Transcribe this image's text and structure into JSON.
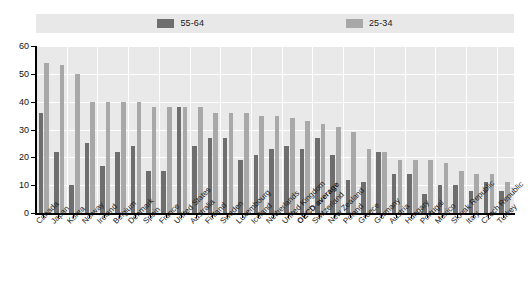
{
  "legend": {
    "items": [
      {
        "label": "55-64",
        "color": "#6e6e6e",
        "icon": "legend-swatch-icon"
      },
      {
        "label": "25-34",
        "color": "#a8a8a8",
        "icon": "legend-swatch-icon"
      }
    ]
  },
  "axis": {
    "y_ticks": [
      "0",
      "10",
      "20",
      "30",
      "40",
      "50",
      "60"
    ]
  },
  "chart_data": {
    "type": "bar",
    "title": "",
    "subtitle": "",
    "xlabel": "",
    "ylabel": "",
    "ylim": [
      0,
      60
    ],
    "ytick_step": 10,
    "grid": true,
    "legend_position": "top",
    "categories": [
      "Canada",
      "Japan",
      "Korea",
      "Norway",
      "Ireland",
      "Belgium",
      "Denmark",
      "Spain",
      "France",
      "United States",
      "Australia",
      "Finland",
      "Sweden",
      "Luxembourg",
      "Iceland",
      "Netherlands",
      "United Kingdom",
      "OECD average",
      "Switzerland",
      "New Zealand",
      "Poland",
      "Greece",
      "Germany",
      "Austria",
      "Hungary",
      "Portugal",
      "Mexico",
      "Slovak Republic",
      "Italy",
      "Czech Republic",
      "Turkey"
    ],
    "highlighted_category": "OECD average",
    "series": [
      {
        "name": "55-64",
        "color": "#6e6e6e",
        "values": [
          36,
          22,
          10,
          25,
          17,
          22,
          24,
          15,
          15,
          38,
          24,
          27,
          27,
          19,
          21,
          23,
          24,
          23,
          27,
          21,
          12,
          11,
          22,
          14,
          14,
          7,
          10,
          10,
          8,
          11,
          8
        ]
      },
      {
        "name": "25-34",
        "color": "#a8a8a8",
        "values": [
          54,
          53,
          50,
          40,
          40,
          40,
          40,
          38,
          38,
          38,
          38,
          36,
          36,
          36,
          35,
          35,
          34,
          33,
          32,
          31,
          29,
          23,
          22,
          19,
          19,
          19,
          18,
          15,
          14,
          14,
          11
        ]
      }
    ]
  }
}
